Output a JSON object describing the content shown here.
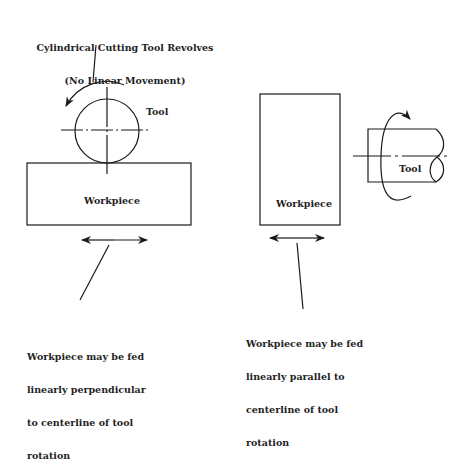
{
  "left_figure": {
    "title_line1": "Cylindrical Cutting Tool Revolves",
    "title_line2": "(No Linear Movement)",
    "tool_label": "Tool",
    "workpiece_label": "Workpiece",
    "caption_line1": "Workpiece may be fed",
    "caption_line2": "linearly perpendicular",
    "caption_line3": "to centerline of tool",
    "caption_line4": "rotation"
  },
  "right_figure": {
    "tool_label": "Tool",
    "workpiece_label": "Workpiece",
    "caption_line1": "Workpiece may be fed",
    "caption_line2": "linearly parallel to",
    "caption_line3": "centerline of tool",
    "caption_line4": "rotation"
  },
  "colors": {
    "line": "#1a1a1a",
    "background": "#ffffff"
  }
}
